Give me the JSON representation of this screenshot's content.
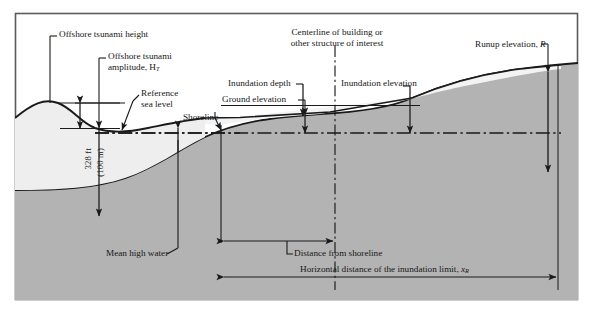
{
  "figure": {
    "type": "tsunami-inundation-cross-section-diagram",
    "border_color": "#555555",
    "background": "#ffffff"
  },
  "colors": {
    "ground_fill": "#b3b3b3",
    "bedrock_fill": "#a8a8a8",
    "water_fill": "#eeeeee",
    "line": "#1a1a1a",
    "text": "#171717"
  },
  "labels": {
    "offshore_tsunami_height": "Offshore tsunami height",
    "offshore_tsunami_amplitude_line1": "Offshore tsunami",
    "offshore_tsunami_amplitude_line2": "amplitude, H",
    "offshore_tsunami_amplitude_sub": "T",
    "reference_sea_level_line1": "Reference",
    "reference_sea_level_line2": "sea level",
    "depth_imperial": "328 ft",
    "depth_metric": "(100 m)",
    "shoreline": "Shoreline",
    "mean_high_water": "Mean high water",
    "ground_elevation": "Ground elevation",
    "inundation_depth": "Inundation depth",
    "inundation_elevation": "Inundation elevation",
    "centerline_line1": "Centerline of building or",
    "centerline_line2": "other structure of interest",
    "runup_elevation": "Runup elevation, ",
    "runup_elevation_symbol": "R",
    "distance_from_shoreline": "Distance from shoreline",
    "horizontal_distance_prefix": "Horizontal distance of the inundation limit, ",
    "horizontal_distance_symbol": "x",
    "horizontal_distance_sub": "R"
  }
}
